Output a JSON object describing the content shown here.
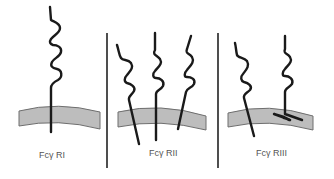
{
  "figure": {
    "panels": [
      {
        "label": "Fcγ RI",
        "chains": 1,
        "ig_domains": 3
      },
      {
        "label": "Fcγ RII",
        "chains": 3,
        "ig_domains": 2
      },
      {
        "label": "Fcγ RIII",
        "chains": 2,
        "ig_domains": 2
      }
    ],
    "colors": {
      "membrane_fill": "#bdbdbd",
      "membrane_stroke": "#6e6e6e",
      "chain": "#1a1a1a",
      "divider": "#222222",
      "label": "#555555"
    }
  }
}
